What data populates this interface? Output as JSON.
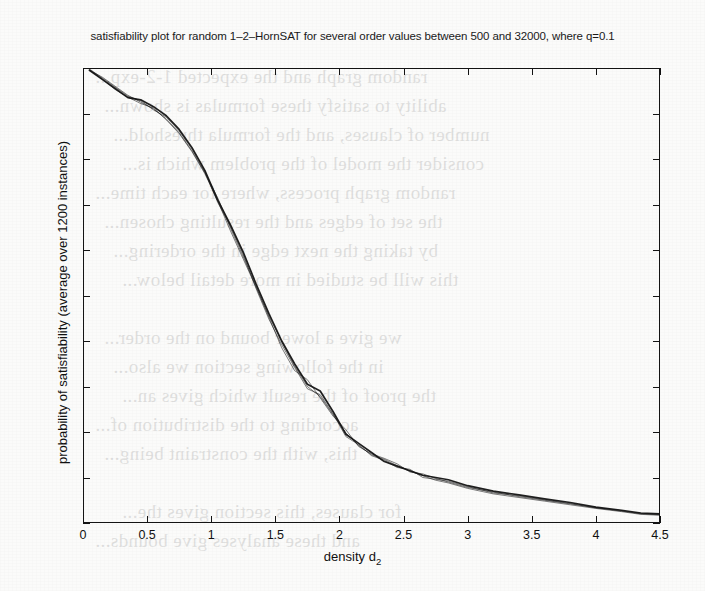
{
  "chart_data": {
    "type": "line",
    "title_parts": {
      "before_sub": "satisfiability plot for random 1–2–HornSAT for several order values between 500 and 32000, where q=0.1"
    },
    "xlabel": "density d",
    "xlabel_sub": "2",
    "ylabel": "probability of satisfiability (average over 1200 instances)",
    "xlim": [
      0,
      4.5
    ],
    "ylim": [
      0,
      1
    ],
    "xticks": [
      "0",
      "0.5",
      "1",
      "1.5",
      "2",
      "2.5",
      "3",
      "3.5",
      "4",
      "4.5"
    ],
    "xtick_values": [
      0,
      0.5,
      1,
      1.5,
      2,
      2.5,
      3,
      3.5,
      4,
      4.5
    ],
    "yticks": [
      "0",
      "0.1",
      "0.2",
      "0.3",
      "0.4",
      "0.5",
      "0.6",
      "0.7",
      "0.8",
      "0.9",
      "1"
    ],
    "ytick_values": [
      0,
      0.1,
      0.2,
      0.3,
      0.4,
      0.5,
      0.6,
      0.7,
      0.8,
      0.9,
      1
    ],
    "grid": false,
    "legend": "none",
    "line_color": "#141414",
    "axis_color": "#141414",
    "background_color": "#ffffff",
    "series": [
      {
        "name": "order 500",
        "x": [
          0.05,
          0.15,
          0.25,
          0.35,
          0.45,
          0.55,
          0.65,
          0.75,
          0.85,
          0.95,
          1.05,
          1.15,
          1.25,
          1.35,
          1.45,
          1.55,
          1.65,
          1.75,
          1.85,
          1.95,
          2.05,
          2.15,
          2.25,
          2.35,
          2.45,
          2.55,
          2.65,
          2.75,
          2.85,
          3.0,
          3.2,
          3.4,
          3.6,
          3.8,
          4.0,
          4.2,
          4.35,
          4.5
        ],
        "values": [
          0.995,
          0.975,
          0.955,
          0.935,
          0.93,
          0.915,
          0.895,
          0.865,
          0.825,
          0.775,
          0.71,
          0.655,
          0.595,
          0.525,
          0.46,
          0.4,
          0.35,
          0.305,
          0.29,
          0.245,
          0.195,
          0.175,
          0.155,
          0.135,
          0.125,
          0.115,
          0.105,
          0.1,
          0.095,
          0.082,
          0.07,
          0.062,
          0.053,
          0.045,
          0.035,
          0.028,
          0.022,
          0.02
        ]
      },
      {
        "name": "order 2000",
        "x": [
          0.05,
          0.15,
          0.25,
          0.35,
          0.45,
          0.55,
          0.65,
          0.75,
          0.85,
          0.95,
          1.05,
          1.15,
          1.25,
          1.35,
          1.45,
          1.55,
          1.65,
          1.75,
          1.85,
          1.95,
          2.05,
          2.15,
          2.25,
          2.35,
          2.45,
          2.55,
          2.65,
          2.75,
          2.85,
          3.0,
          3.2,
          3.4,
          3.6,
          3.8,
          4.0,
          4.2,
          4.35,
          4.5
        ],
        "values": [
          0.995,
          0.98,
          0.96,
          0.94,
          0.925,
          0.91,
          0.888,
          0.858,
          0.818,
          0.77,
          0.715,
          0.648,
          0.585,
          0.52,
          0.452,
          0.385,
          0.335,
          0.315,
          0.275,
          0.235,
          0.205,
          0.168,
          0.152,
          0.142,
          0.13,
          0.112,
          0.108,
          0.098,
          0.09,
          0.078,
          0.068,
          0.058,
          0.05,
          0.042,
          0.034,
          0.026,
          0.021,
          0.019
        ]
      },
      {
        "name": "order 8000",
        "x": [
          0.05,
          0.15,
          0.25,
          0.35,
          0.45,
          0.55,
          0.65,
          0.75,
          0.85,
          0.95,
          1.05,
          1.15,
          1.25,
          1.35,
          1.45,
          1.55,
          1.65,
          1.75,
          1.85,
          1.95,
          2.05,
          2.15,
          2.25,
          2.35,
          2.45,
          2.55,
          2.65,
          2.75,
          2.85,
          3.0,
          3.2,
          3.4,
          3.6,
          3.8,
          4.0,
          4.2,
          4.35,
          4.5
        ],
        "values": [
          0.998,
          0.978,
          0.958,
          0.938,
          0.928,
          0.908,
          0.892,
          0.862,
          0.822,
          0.772,
          0.705,
          0.652,
          0.59,
          0.515,
          0.448,
          0.392,
          0.342,
          0.295,
          0.282,
          0.24,
          0.19,
          0.172,
          0.148,
          0.138,
          0.122,
          0.118,
          0.1,
          0.096,
          0.092,
          0.08,
          0.066,
          0.06,
          0.051,
          0.043,
          0.033,
          0.027,
          0.02,
          0.018
        ]
      },
      {
        "name": "order 32000",
        "x": [
          0.05,
          0.15,
          0.25,
          0.35,
          0.45,
          0.55,
          0.65,
          0.75,
          0.85,
          0.95,
          1.05,
          1.15,
          1.25,
          1.35,
          1.45,
          1.55,
          1.65,
          1.75,
          1.85,
          1.95,
          2.05,
          2.15,
          2.25,
          2.35,
          2.45,
          2.55,
          2.65,
          2.75,
          2.85,
          3.0,
          3.2,
          3.4,
          3.6,
          3.8,
          4.0,
          4.2,
          4.35,
          4.5
        ],
        "values": [
          0.996,
          0.976,
          0.953,
          0.936,
          0.922,
          0.912,
          0.886,
          0.856,
          0.816,
          0.768,
          0.708,
          0.642,
          0.58,
          0.518,
          0.455,
          0.398,
          0.345,
          0.3,
          0.278,
          0.238,
          0.198,
          0.17,
          0.15,
          0.14,
          0.126,
          0.114,
          0.104,
          0.094,
          0.088,
          0.076,
          0.064,
          0.056,
          0.048,
          0.04,
          0.032,
          0.025,
          0.019,
          0.017
        ]
      }
    ]
  },
  "page_bleed": {
    "lines": [
      "random graph and the expected 1-2-exp...",
      "ability to satisfy these formulas is shown...",
      "number of clauses, and the formula threshold...",
      "consider the model of the problem which is...",
      "random graph process, where for each time...",
      "the set of edges and the resulting chosen...",
      "by taking the next edge in the ordering...",
      "this will be studied in more detail below...",
      "",
      "we give a lower bound on the order...",
      "in the following section we also...",
      "the proof of the result which gives an...",
      "according to the distribution of...",
      "this, with the constraint being...",
      "",
      "for clauses, this section gives the...",
      "and these analyses give bounds..."
    ]
  }
}
